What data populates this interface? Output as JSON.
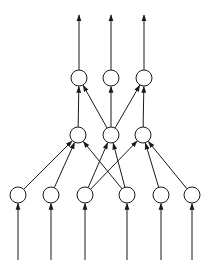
{
  "diagram": {
    "type": "feedforward-neural-network",
    "colors": {
      "stroke": "#1a1a1a",
      "node_fill": "#ffffff",
      "background": "#ffffff"
    },
    "node_radius": 8,
    "layers": [
      {
        "name": "output",
        "nodes": [
          {
            "id": "t0",
            "x": 79,
            "y": 78
          },
          {
            "id": "t1",
            "x": 111,
            "y": 78
          },
          {
            "id": "t2",
            "x": 144,
            "y": 78
          }
        ]
      },
      {
        "name": "hidden",
        "nodes": [
          {
            "id": "m0",
            "x": 78,
            "y": 135
          },
          {
            "id": "m1",
            "x": 111,
            "y": 135
          },
          {
            "id": "m2",
            "x": 143,
            "y": 135
          }
        ]
      },
      {
        "name": "input",
        "nodes": [
          {
            "id": "b0",
            "x": 18,
            "y": 195
          },
          {
            "id": "b1",
            "x": 51,
            "y": 195
          },
          {
            "id": "b2",
            "x": 85,
            "y": 195
          },
          {
            "id": "b3",
            "x": 127,
            "y": 195
          },
          {
            "id": "b4",
            "x": 161,
            "y": 195
          },
          {
            "id": "b5",
            "x": 192,
            "y": 195
          }
        ]
      }
    ],
    "edges": [
      [
        "b0",
        "m0"
      ],
      [
        "b1",
        "m0"
      ],
      [
        "b3",
        "m0"
      ],
      [
        "b2",
        "m1"
      ],
      [
        "b3",
        "m1"
      ],
      [
        "b2",
        "m2"
      ],
      [
        "b4",
        "m2"
      ],
      [
        "b5",
        "m2"
      ],
      [
        "m0",
        "t0"
      ],
      [
        "m1",
        "t0"
      ],
      [
        "m1",
        "t1"
      ],
      [
        "m1",
        "t2"
      ],
      [
        "m2",
        "t2"
      ]
    ],
    "output_arrow_top_y": 15,
    "input_line_bottom_y": 260
  }
}
